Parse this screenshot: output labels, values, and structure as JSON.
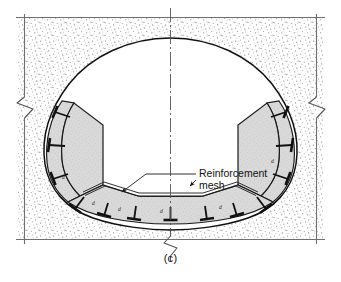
{
  "figure": {
    "caption": "(c)",
    "kind": "tunnel-cross-section-drawing",
    "annotations": [
      {
        "id": "reinforcement-mesh",
        "line1": "Reinforcement",
        "line2": "mesh"
      }
    ],
    "bolt_labels": [
      "d",
      "d",
      "d",
      "d",
      "d",
      "d"
    ],
    "colors": {
      "ink": "#1a1a1a",
      "lining_fill": "#d8d8d8",
      "stipple": "#9a9a9a",
      "ground": "#ffffff",
      "thin_rule": "#6f6f6f",
      "centerline": "#555555"
    },
    "elements": {
      "ground_label": "stippled-rock-mass",
      "opening_label": "tunnel-opening",
      "lining_label": "concrete-lining",
      "bolts_label": "rock-bolt",
      "centerline_label": "vertical-centerline",
      "break_label": "break-symbol",
      "border_label": "frame-rule"
    }
  }
}
